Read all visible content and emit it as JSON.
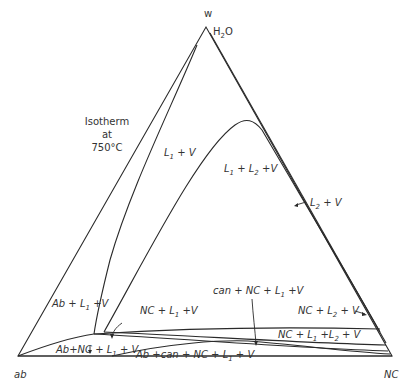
{
  "diagram": {
    "title_lines": [
      "Isotherm",
      "at",
      "750°C"
    ],
    "vertices": {
      "top": {
        "label": "w",
        "formula": "H",
        "formula_sub": "2",
        "formula_tail": "O"
      },
      "left": {
        "label": "ab"
      },
      "right": {
        "label": "NC"
      }
    },
    "fields": {
      "l1_v": {
        "a": "L",
        "a_sub": "1",
        "b": " + V"
      },
      "l1_l2_v": {
        "a": "L",
        "a_sub": "1",
        "b": " + L",
        "b_sub": "2",
        "c": " +V"
      },
      "l2_v": {
        "a": "L",
        "a_sub": "2",
        "b": " + V"
      },
      "ab_l1_v": {
        "a": "Ab + L",
        "a_sub": "1",
        "b": " +V"
      },
      "nc_l1_v": {
        "a": "NC + L",
        "a_sub": "1",
        "b": " +V"
      },
      "can_nc_l1_v": {
        "a": "can + NC + L",
        "a_sub": "1",
        "b": " +V"
      },
      "nc_l2_v": {
        "a": "NC + L",
        "a_sub": "2",
        "b": " + V"
      },
      "nc_l1_l2_v": {
        "a": "NC + L",
        "a_sub": "1",
        "b": " +L",
        "b_sub": "2",
        "c": " + V"
      },
      "ab_nc_l1_v": {
        "a": "Ab+NC + L",
        "a_sub": "1",
        "b": " + V"
      },
      "ab_can_nc_l1_v": {
        "a": "Ab +can + NC + L",
        "a_sub": "1",
        "b": " + V"
      }
    }
  }
}
